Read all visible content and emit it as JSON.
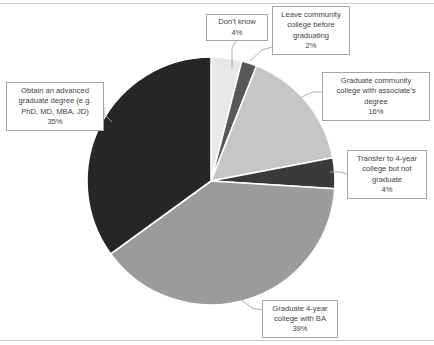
{
  "chart_data": {
    "type": "pie",
    "title": "",
    "subtitle": "",
    "xlabel": "",
    "ylabel": "",
    "legend_position": "none",
    "grid": false,
    "unit": "%",
    "start_angle_deg": 0,
    "direction": "clockwise",
    "categories": [
      "Don't know",
      "Leave community college before graduating",
      "Graduate community college with associate's degree",
      "Transfer to 4-year college but not graduate",
      "Graduate 4-year college with BA",
      "Obtain an advanced graduate degree (e.g. PhD, MD, MBA, JD)"
    ],
    "values": [
      4,
      2,
      16,
      4,
      39,
      35
    ],
    "colors": [
      "#e8e8e8",
      "#585858",
      "#c6c6c6",
      "#3a3a3a",
      "#9b9b9b",
      "#262626"
    ],
    "slices": [
      {
        "label": "Don't know",
        "value": 4,
        "value_text": "4%",
        "color": "#e8e8e8",
        "start_deg": 0,
        "end_deg": 14.4
      },
      {
        "label": "Leave community college before graduating",
        "value": 2,
        "value_text": "2%",
        "color": "#585858",
        "start_deg": 14.4,
        "end_deg": 21.6
      },
      {
        "label": "Graduate community college with associate's degree",
        "value": 16,
        "value_text": "16%",
        "color": "#c6c6c6",
        "start_deg": 21.6,
        "end_deg": 79.2
      },
      {
        "label": "Transfer to 4-year college but not graduate",
        "value": 4,
        "value_text": "4%",
        "color": "#3a3a3a",
        "start_deg": 79.2,
        "end_deg": 93.6
      },
      {
        "label": "Graduate 4-year college with BA",
        "value": 39,
        "value_text": "39%",
        "color": "#9b9b9b",
        "start_deg": 93.6,
        "end_deg": 234.0
      },
      {
        "label": "Obtain an advanced graduate degree (e.g. PhD, MD, MBA, JD)",
        "value": 35,
        "value_text": "35%",
        "color": "#262626",
        "start_deg": 234.0,
        "end_deg": 360.0
      }
    ]
  },
  "callouts": {
    "dont_know": {
      "text": "Don't know",
      "pct": "4%"
    },
    "leave_community_college": {
      "text": "Leave community\ncollege before\ngraduating",
      "pct": "2%"
    },
    "graduate_community_college": {
      "text": "Graduate community\ncollege with associate's\ndegree",
      "pct": "16%"
    },
    "transfer_not_graduate": {
      "text": "Transfer to 4-year\ncollege but not\ngraduate",
      "pct": "4%"
    },
    "advanced_degree": {
      "text": "Obtain an advanced\ngraduate degree (e.g.\nPhD, MD, MBA, JD)",
      "pct": "35%"
    },
    "graduate_ba": {
      "text": "Graduate 4-year\ncollege with BA",
      "pct": "39%"
    }
  }
}
